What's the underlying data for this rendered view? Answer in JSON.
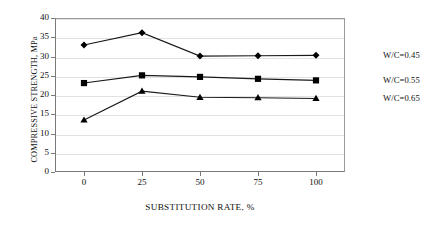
{
  "chart_data": {
    "type": "line",
    "title": "",
    "xlabel": "SUBSTITUTION RATE, %",
    "ylabel": "COMPRESSIVE STRENGTH, MPa",
    "x": [
      0,
      25,
      50,
      75,
      100
    ],
    "xticklabels": [
      "0",
      "25",
      "50",
      "75",
      "100"
    ],
    "yticklabels": [
      "0",
      "5",
      "10",
      "15",
      "20",
      "25",
      "30",
      "35",
      "40"
    ],
    "xlim": [
      -12.5,
      112.5
    ],
    "ylim": [
      0,
      40
    ],
    "grid": true,
    "legend_position": "right-inline",
    "series": [
      {
        "name": "W/C=0.45",
        "marker": "diamond",
        "values": [
          33.0,
          36.2,
          30.1,
          30.2,
          30.3
        ]
      },
      {
        "name": "W/C=0.55",
        "marker": "square",
        "values": [
          23.1,
          25.1,
          24.7,
          24.2,
          23.8
        ]
      },
      {
        "name": "W/C=0.65",
        "marker": "triangle",
        "values": [
          13.5,
          21.0,
          19.4,
          19.3,
          19.1
        ]
      }
    ],
    "colors": {
      "line": "#1a1a1a",
      "marker": "#000000",
      "grid": "#e2e2e2",
      "axis": "#7a7a7a",
      "text": "#111111"
    }
  },
  "labels": {
    "series_0": "W/C=0.45",
    "series_1": "W/C=0.55",
    "series_2": "W/C=0.65"
  }
}
